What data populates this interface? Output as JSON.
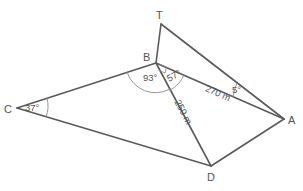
{
  "diagram": {
    "title": "",
    "vertices": {
      "T": {
        "label": "T",
        "x": 161,
        "y": 24
      },
      "B": {
        "label": "B",
        "x": 156,
        "y": 63
      },
      "C": {
        "label": "C",
        "x": 17,
        "y": 108
      },
      "A": {
        "label": "A",
        "x": 284,
        "y": 119
      },
      "D": {
        "label": "D",
        "x": 211,
        "y": 166
      }
    },
    "edges": [
      {
        "from": "T",
        "to": "B"
      },
      {
        "from": "T",
        "to": "A"
      },
      {
        "from": "B",
        "to": "A"
      },
      {
        "from": "B",
        "to": "C"
      },
      {
        "from": "B",
        "to": "D"
      },
      {
        "from": "C",
        "to": "D"
      },
      {
        "from": "D",
        "to": "A"
      }
    ],
    "angles": {
      "C": "37°",
      "CBD": "93°",
      "DBA": "57°",
      "TAB": "5°",
      "TBA": "right-angle"
    },
    "lengths": {
      "BA": "270 m",
      "BD": "250 m"
    },
    "colors": {
      "line": "#5a5a5a",
      "text": "#555555",
      "background": "#ffffff"
    }
  }
}
